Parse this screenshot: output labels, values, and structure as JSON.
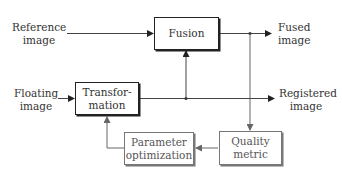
{
  "diagram": {
    "type": "block-diagram",
    "title": "",
    "inputs": {
      "reference": {
        "line1": "Reference",
        "line2": "image"
      },
      "floating": {
        "line1": "Floating",
        "line2": "image"
      }
    },
    "outputs": {
      "fused": {
        "line1": "Fused",
        "line2": "image"
      },
      "registered": {
        "line1": "Registered",
        "line2": "image"
      }
    },
    "blocks": {
      "fusion": {
        "label": "Fusion"
      },
      "transformation": {
        "line1": "Transfor-",
        "line2": "mation"
      },
      "parameter_optimization": {
        "line1": "Parameter",
        "line2": "optimization"
      },
      "quality_metric": {
        "line1": "Quality",
        "line2": "metric"
      }
    },
    "edges": [
      {
        "from": "Reference image",
        "to": "Fusion"
      },
      {
        "from": "Fusion",
        "to": "Fused image"
      },
      {
        "from": "Fusion output",
        "to": "Quality metric"
      },
      {
        "from": "Floating image",
        "to": "Transformation"
      },
      {
        "from": "Transformation",
        "to": "Registered image"
      },
      {
        "from": "Transformation output",
        "to": "Fusion"
      },
      {
        "from": "Quality metric",
        "to": "Parameter optimization"
      },
      {
        "from": "Parameter optimization",
        "to": "Transformation"
      }
    ],
    "colors": {
      "primary": "#222222",
      "feedback": "#777777",
      "text": "#333333"
    }
  }
}
